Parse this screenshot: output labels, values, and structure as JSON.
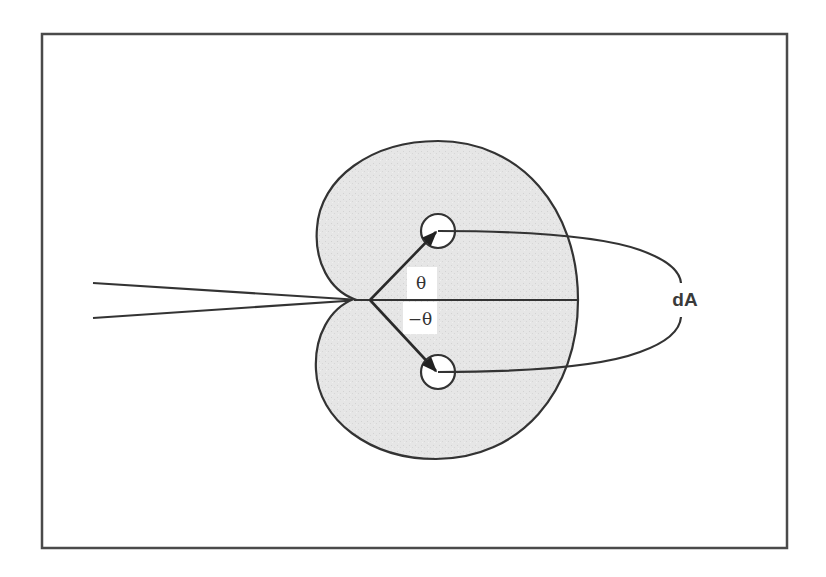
{
  "diagram": {
    "type": "cardioid-polar-pattern",
    "labels": {
      "theta": "θ",
      "neg_theta": "−θ",
      "area": "dA"
    },
    "colors": {
      "background": "#ffffff",
      "fill": "#e4e4e4",
      "stroke": "#333333",
      "frame": "#4a4a4a"
    },
    "elements": [
      "frame",
      "cardioid-region",
      "horizontal-axis",
      "incoming-rays",
      "vector-theta",
      "vector-neg-theta",
      "area-element-circle-top",
      "area-element-circle-bottom",
      "dA-connector-loop"
    ]
  }
}
